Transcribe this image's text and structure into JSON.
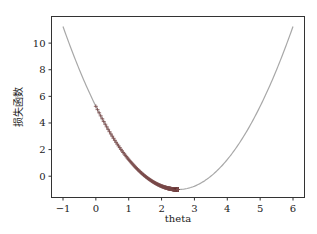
{
  "chart_data": {
    "type": "line",
    "title": "",
    "xlabel": "theta",
    "ylabel": "损失函数",
    "xlim": [
      -1.35,
      6.35
    ],
    "ylim": [
      -1.6,
      12.0
    ],
    "xticks": [
      -1,
      0,
      1,
      2,
      3,
      4,
      5,
      6
    ],
    "yticks": [
      0,
      2,
      4,
      6,
      8,
      10
    ],
    "grid": false,
    "legend": null,
    "series": [
      {
        "name": "loss curve",
        "kind": "line",
        "function": "(theta-2.5)^2-1",
        "x_range": [
          -1,
          6
        ],
        "color": "#a8a8a8"
      },
      {
        "name": "gradient descent path",
        "kind": "markers",
        "marker": "+",
        "color": "#7a4a4a",
        "x_start": 0.0,
        "x_end": 2.5,
        "y_start": 5.25,
        "y_end": -1.0
      }
    ]
  }
}
